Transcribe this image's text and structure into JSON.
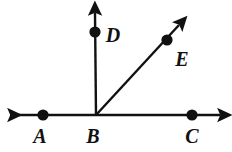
{
  "diagram": {
    "kind": "geometry-angle-diagram",
    "background_color": "#ffffff",
    "stroke_color": "#111111",
    "canvas": {
      "width": 232,
      "height": 152
    },
    "points": [
      {
        "id": "A",
        "label": "A",
        "x": 43,
        "y": 115,
        "label_x": 40,
        "label_y": 143,
        "dot_radius": 5.5
      },
      {
        "id": "B",
        "label": "B",
        "x": 96,
        "y": 115,
        "label_x": 92,
        "label_y": 143,
        "dot_radius": 0
      },
      {
        "id": "C",
        "label": "C",
        "x": 192,
        "y": 115,
        "label_x": 190,
        "label_y": 143,
        "dot_radius": 5.5
      },
      {
        "id": "D",
        "label": "D",
        "x": 95,
        "y": 32,
        "label_x": 106,
        "label_y": 42,
        "dot_radius": 5.5
      },
      {
        "id": "E",
        "label": "E",
        "x": 167,
        "y": 40,
        "label_x": 175,
        "label_y": 66,
        "dot_radius": 5.5
      }
    ],
    "lines": [
      {
        "id": "line-AC",
        "name": "horizontal-line",
        "x1": 10,
        "y1": 115,
        "x2": 220,
        "y2": 115,
        "arrow_start": true,
        "arrow_end": true,
        "stroke_width": 2.4
      },
      {
        "id": "ray-BD",
        "name": "vertical-ray",
        "x1": 96,
        "y1": 115,
        "x2": 95,
        "y2": 12,
        "arrow_start": false,
        "arrow_end": true,
        "stroke_width": 2.4
      },
      {
        "id": "ray-BE",
        "name": "diagonal-ray",
        "x1": 96,
        "y1": 115,
        "x2": 180,
        "y2": 24,
        "arrow_start": false,
        "arrow_end": true,
        "stroke_width": 2.4
      }
    ],
    "labels": {
      "A": "A",
      "B": "B",
      "C": "C",
      "D": "D",
      "E": "E"
    }
  }
}
